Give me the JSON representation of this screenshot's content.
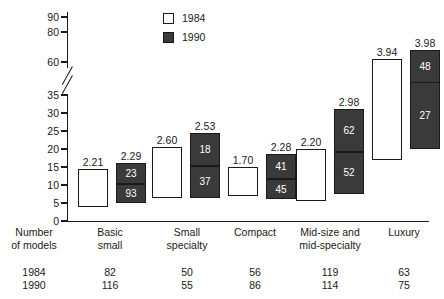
{
  "chart_data": {
    "type": "bar",
    "title": "",
    "subtitle": "",
    "xlabel": "",
    "ylabel": "",
    "grid": false,
    "legend_position": "top-center",
    "y_axis": {
      "ticks": [
        0,
        5,
        10,
        15,
        20,
        25,
        30,
        35,
        60,
        80,
        90
      ],
      "broken": true,
      "break_between": [
        35,
        60
      ],
      "lower_range": [
        0,
        35
      ],
      "upper_range": [
        60,
        90
      ]
    },
    "legend": [
      {
        "label": "1984",
        "style": "open"
      },
      {
        "label": "1990",
        "style": "filled"
      }
    ],
    "categories": [
      "Basic small",
      "Small specialty",
      "Compact",
      "Mid-size and mid-specialty",
      "Luxury"
    ],
    "series": [
      {
        "name": "1984",
        "style": "open",
        "bar_labels": [
          "2.21",
          "2.60",
          "1.70",
          "2.20",
          "3.94"
        ],
        "bar_bottom": [
          4.0,
          6.5,
          7.0,
          5.5,
          17.0
        ],
        "bar_top": [
          14.5,
          20.5,
          15.0,
          20.0,
          62.0
        ]
      },
      {
        "name": "1990",
        "style": "filled",
        "bar_labels": [
          "2.29",
          "2.53",
          "2.28",
          "2.98",
          "3.98"
        ],
        "bar_bottom": [
          5.0,
          6.5,
          6.0,
          7.5,
          20.0
        ],
        "bar_top": [
          16.0,
          24.5,
          18.5,
          31.0,
          68.0
        ],
        "segment_values": [
          [
            "23",
            "93"
          ],
          [
            "18",
            "37"
          ],
          [
            "41",
            "45"
          ],
          [
            "62",
            "52"
          ],
          [
            "48",
            "27"
          ]
        ],
        "segment_split": [
          10.5,
          15.5,
          12.0,
          19.5,
          47.0
        ]
      }
    ],
    "row_header": {
      "line1": "Number",
      "line2": "of models"
    },
    "table": {
      "rows": [
        {
          "label": "1984",
          "values": [
            "82",
            "50",
            "56",
            "119",
            "63"
          ]
        },
        {
          "label": "1990",
          "values": [
            "116",
            "55",
            "86",
            "114",
            "75"
          ]
        }
      ]
    },
    "colors": {
      "filled": "#3a3a3a",
      "open": "#ffffff",
      "outline": "#1a1a1a",
      "text": "#1a1a1a",
      "segment_text": "#ffffff"
    }
  },
  "cat_lines": [
    {
      "l1": "Basic",
      "l2": "small"
    },
    {
      "l1": "Small",
      "l2": "specialty"
    },
    {
      "l1": "Compact",
      "l2": ""
    },
    {
      "l1": "Mid-size and",
      "l2": "mid-specialty"
    },
    {
      "l1": "Luxury",
      "l2": ""
    }
  ]
}
